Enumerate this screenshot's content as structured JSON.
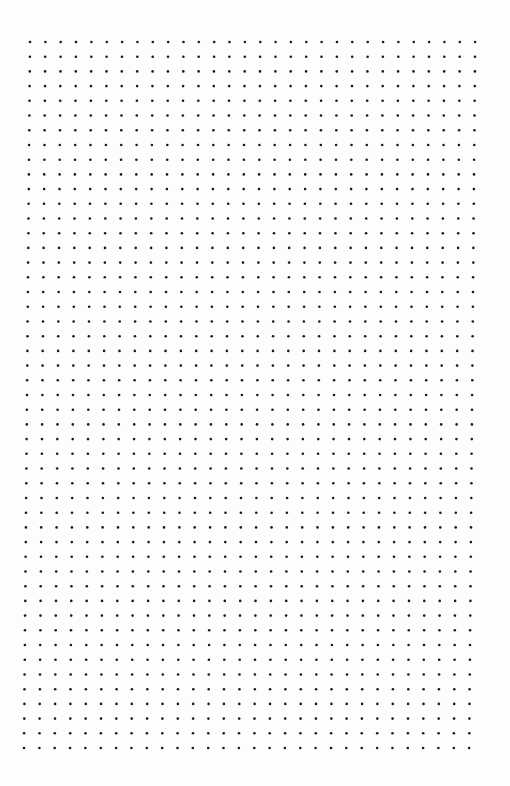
{
  "page": {
    "type": "dot-grid-paper",
    "width": 510,
    "height": 786,
    "background": "#fdfdfd"
  },
  "grid": {
    "rows": 49,
    "columns": 30,
    "origin_top_left": [
      30,
      42
    ],
    "origin_bottom_left": [
      24,
      748
    ],
    "column_spacing": 15.35,
    "dot_radius": 1.3,
    "dot_color": "#1a1a1a"
  }
}
